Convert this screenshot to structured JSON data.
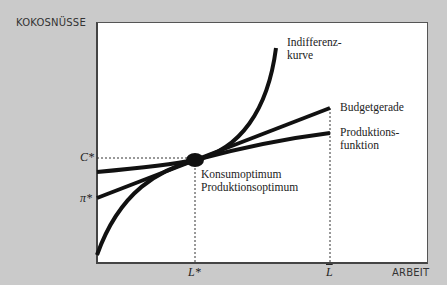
{
  "diagram": {
    "y_axis_label": "KOKOSNÜSSE",
    "x_axis_label": "ARBEIT",
    "y_ticks": {
      "c_star": "C*",
      "pi_star": "π*"
    },
    "x_ticks": {
      "l_star": "L*",
      "l_bar": "L"
    },
    "curves": {
      "indifference": {
        "label_line1": "Indifferenz-",
        "label_line2": "kurve"
      },
      "budget": {
        "label": "Budgetgerade"
      },
      "production": {
        "label_line1": "Produktions-",
        "label_line2": "funktion"
      }
    },
    "optimum": {
      "label_line1": "Konsumoptimum",
      "label_line2": "Produktionsoptimum"
    },
    "colors": {
      "background": "#cacaca",
      "plot": "#ffffff",
      "curve": "#111111",
      "dashed": "#333333"
    }
  }
}
